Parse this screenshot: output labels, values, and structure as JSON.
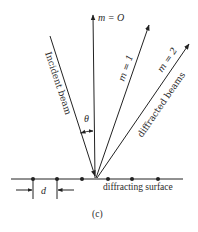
{
  "figure": {
    "caption": "(c)",
    "beams": {
      "incident": {
        "label": "Incident beam"
      },
      "m0": {
        "label": "m = O"
      },
      "m1": {
        "label": "m = 1"
      },
      "m2": {
        "label": "m = 2"
      },
      "diffracted_group": {
        "label": "diffracted beams"
      }
    },
    "angle_label": "θ",
    "spacing_label": "d",
    "surface_label": "diffracting surface",
    "colors": {
      "line": "#222222",
      "background": "#ffffff"
    }
  }
}
